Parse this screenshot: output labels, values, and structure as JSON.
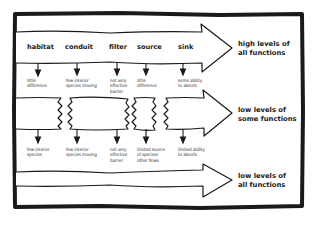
{
  "diagram": {
    "columns": [
      {
        "label": "habitat",
        "x": 27
      },
      {
        "label": "conduit",
        "x": 65
      },
      {
        "label": "filter",
        "x": 109
      },
      {
        "label": "source",
        "x": 137
      },
      {
        "label": "sink",
        "x": 178
      }
    ],
    "rows": [
      {
        "level_label": "high levels of\nall functions",
        "state": "continuous",
        "effects": [
          "little\ndifference",
          "few interior\nspecies moving",
          "not very\neffective\nbarrier",
          "little\ndifference",
          "some ability\nto absorb"
        ]
      },
      {
        "level_label": "low levels of\nsome functions",
        "state": "broken",
        "effects": [
          "few interior\nspecies",
          "few interior\nspecies moving",
          "not very\neffective\nbarrier",
          "limited source\nof species/\nother flows",
          "limited ability\nto absorb"
        ]
      },
      {
        "level_label": "low levels of\nall functions",
        "state": "narrow",
        "effects": []
      }
    ],
    "colors": {
      "ink": "#1a1a1a",
      "background": "#ffffff"
    }
  }
}
